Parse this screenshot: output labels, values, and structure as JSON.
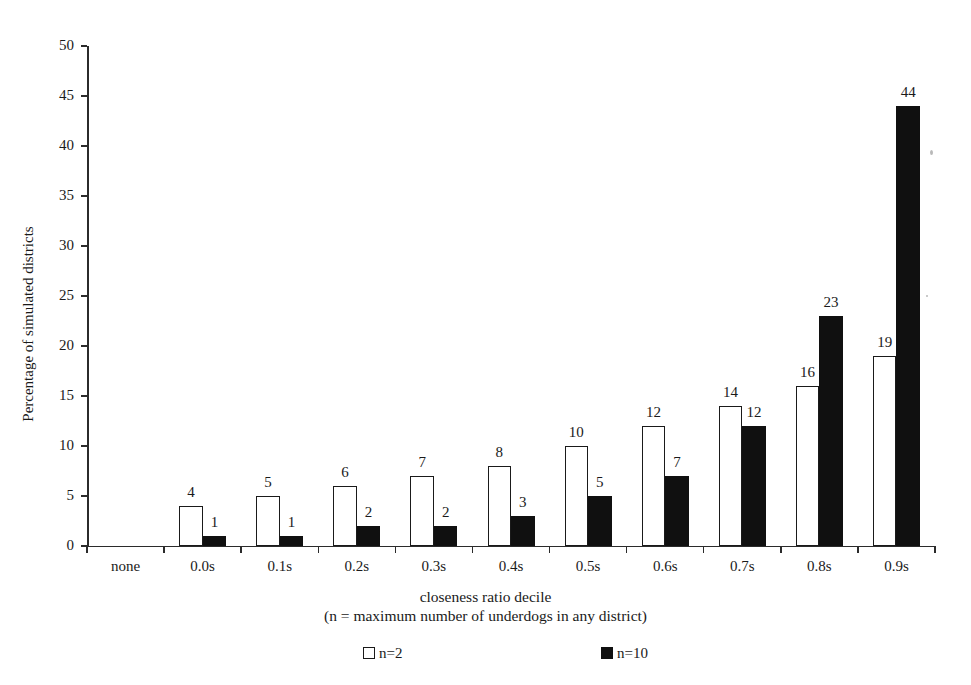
{
  "chart_data": {
    "type": "bar",
    "title": "",
    "subtitle": "",
    "xlabel": "closeness ratio decile",
    "xlabel_note": "(n = maximum number of underdogs in any district)",
    "ylabel": "Percentage of simulated districts",
    "categories": [
      "none",
      "0.0s",
      "0.1s",
      "0.2s",
      "0.3s",
      "0.4s",
      "0.5s",
      "0.6s",
      "0.7s",
      "0.8s",
      "0.9s"
    ],
    "series": [
      {
        "name": "n=2",
        "color": "#ffffff",
        "edge_color": "#1a1a1a",
        "values": [
          0,
          4,
          5,
          6,
          7,
          8,
          10,
          12,
          14,
          16,
          19
        ]
      },
      {
        "name": "n=10",
        "color": "#101010",
        "edge_color": "#101010",
        "values": [
          0,
          1,
          1,
          2,
          2,
          3,
          5,
          7,
          12,
          23,
          44
        ]
      }
    ],
    "ylim": [
      0,
      50
    ],
    "ytick_labels": [
      "0",
      "5",
      "10",
      "15",
      "20",
      "25",
      "30",
      "35",
      "40",
      "45",
      "50"
    ],
    "ytick_values": [
      0,
      5,
      10,
      15,
      20,
      25,
      30,
      35,
      40,
      45,
      50
    ],
    "ytick_step": 5,
    "grid": false,
    "legend_position": "bottom",
    "show_value_labels": true,
    "bar_label_format": "integer"
  }
}
